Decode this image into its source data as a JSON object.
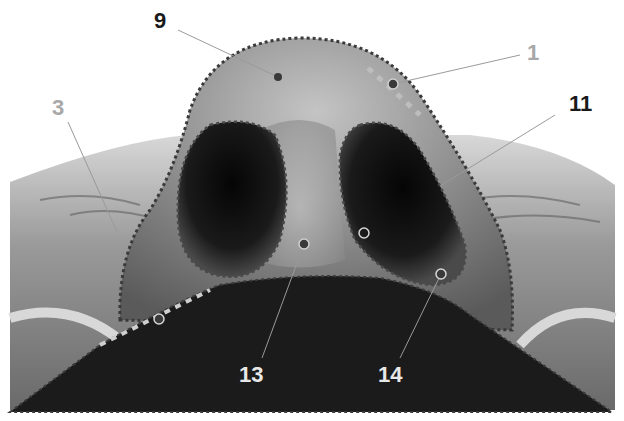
{
  "figure": {
    "type": "anatomical-illustration",
    "colors": {
      "background": "#ffffff",
      "skin_light": "#bdbdbd",
      "skin_mid": "#8a8a8a",
      "skin_dark": "#555555",
      "nostril": "#111111",
      "lip_mask": "#1b1b1b",
      "outline_dark": "#3a3a3a",
      "outline_light": "#c8c8c8",
      "leader_line": "#9a9a9a"
    },
    "labels": [
      {
        "id": "9",
        "text": "9",
        "x": 154,
        "y": 10,
        "style": "dark",
        "point": [
          278,
          77
        ]
      },
      {
        "id": "1",
        "text": "1",
        "x": 527,
        "y": 42,
        "style": "grey",
        "point": [
          393,
          84
        ]
      },
      {
        "id": "3",
        "text": "3",
        "x": 52,
        "y": 97,
        "style": "grey",
        "point": [
          117,
          232
        ]
      },
      {
        "id": "11",
        "text": "11",
        "x": 569,
        "y": 93,
        "style": "dark",
        "point": [
          440,
          186
        ]
      },
      {
        "id": "13",
        "text": "13",
        "x": 239,
        "y": 364,
        "style": "light",
        "point": [
          304,
          244
        ]
      },
      {
        "id": "14",
        "text": "14",
        "x": 378,
        "y": 364,
        "style": "light",
        "point": [
          441,
          274
        ]
      }
    ],
    "extra_points": [
      {
        "x": 364,
        "y": 233,
        "style": "ring"
      },
      {
        "x": 159,
        "y": 319,
        "style": "ring"
      }
    ]
  }
}
